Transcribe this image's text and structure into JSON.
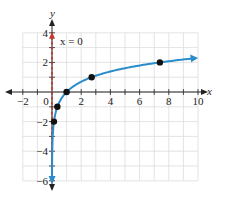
{
  "chart_data": {
    "type": "line",
    "title": "",
    "function": "y = ln x",
    "xlabel": "x",
    "ylabel": "y",
    "xlim": [
      -2,
      10
    ],
    "ylim": [
      -6,
      4
    ],
    "grid": true,
    "x_ticks": [
      -2,
      0,
      2,
      4,
      6,
      8,
      10
    ],
    "x_tick_labels": [
      "−2",
      "0",
      "2",
      "4",
      "6",
      "8",
      "10"
    ],
    "y_ticks": [
      -6,
      -4,
      -2,
      2,
      4
    ],
    "y_tick_labels": [
      "−6",
      "−4",
      "−2",
      "2",
      "4"
    ],
    "series": [
      {
        "name": "y = ln x",
        "color": "#2b8ccc",
        "points": [
          {
            "x": 0.135,
            "y": -2
          },
          {
            "x": 0.368,
            "y": -1
          },
          {
            "x": 1,
            "y": 0
          },
          {
            "x": 2.718,
            "y": 1
          },
          {
            "x": 7.389,
            "y": 2
          }
        ]
      }
    ],
    "asymptote": {
      "label": "x = 0",
      "x": 0,
      "color": "#c0392b",
      "style": "dashed"
    },
    "annotations": [
      "x = 0"
    ]
  }
}
